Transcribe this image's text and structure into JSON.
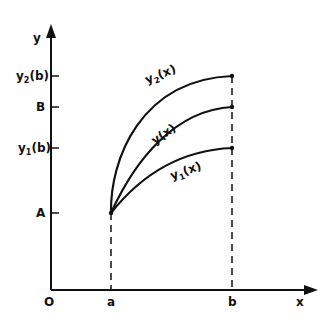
{
  "diagram": {
    "axes": {
      "x_label": "x",
      "y_label": "y",
      "origin_label": "O"
    },
    "x_ticks": [
      {
        "label": "a"
      },
      {
        "label": "b"
      }
    ],
    "y_ticks": [
      {
        "base": "y",
        "sub": "2",
        "suffix": "(b)"
      },
      {
        "base": "B",
        "sub": "",
        "suffix": ""
      },
      {
        "base": "y",
        "sub": "1",
        "suffix": "(b)"
      },
      {
        "base": "A",
        "sub": "",
        "suffix": ""
      }
    ],
    "curves": [
      {
        "base": "y",
        "sub": "2",
        "suffix": "(x)"
      },
      {
        "base": "y",
        "sub": "",
        "suffix": "(x)"
      },
      {
        "base": "y",
        "sub": "1",
        "suffix": "(x)"
      }
    ],
    "colors": {
      "ink": "#111111",
      "background": "#ffffff"
    }
  }
}
